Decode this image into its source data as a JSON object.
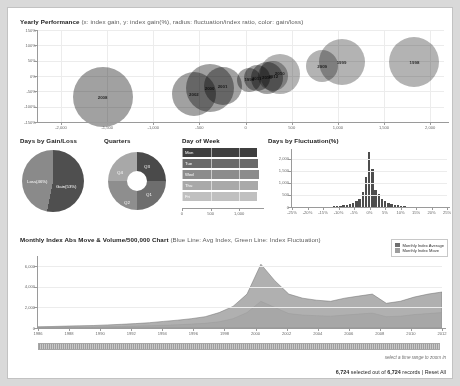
{
  "bubble": {
    "title": "Yearly Performance",
    "subtitle": "(x: index gain, y: index gain(%), radius: fluctuation/index ratio, color: gain/loss)",
    "ylabels": [
      "150%",
      "100%",
      "50%",
      "0%",
      "-50%",
      "-100%",
      "-150%"
    ],
    "xlabels": [
      "-2,000",
      "-1,500",
      "-1,000",
      "-500",
      "0",
      "500",
      "1,000",
      "1,500",
      "2,000"
    ],
    "points": [
      {
        "label": "2008",
        "x": -1550,
        "y": -70,
        "r": 30,
        "kind": "loss"
      },
      {
        "label": "2002",
        "x": -560,
        "y": -60,
        "r": 22,
        "kind": "loss"
      },
      {
        "label": "2000",
        "x": -390,
        "y": -40,
        "r": 24,
        "kind": "loss"
      },
      {
        "label": "2001",
        "x": -250,
        "y": -33,
        "r": 19,
        "kind": "loss"
      },
      {
        "label": "1990",
        "x": 40,
        "y": -12,
        "r": 12,
        "kind": "loss"
      },
      {
        "label": "2011",
        "x": 120,
        "y": -8,
        "r": 13,
        "kind": "loss"
      },
      {
        "label": "2015",
        "x": 230,
        "y": -5,
        "r": 16,
        "kind": "loss"
      },
      {
        "label": "2012",
        "x": 300,
        "y": 0,
        "r": 15,
        "kind": "gain"
      },
      {
        "label": "2010",
        "x": 370,
        "y": 8,
        "r": 20,
        "kind": "gain"
      },
      {
        "label": "2009",
        "x": 830,
        "y": 32,
        "r": 16,
        "kind": "gain"
      },
      {
        "label": "1999",
        "x": 1040,
        "y": 45,
        "r": 23,
        "kind": "gain"
      },
      {
        "label": "1998",
        "x": 1830,
        "y": 45,
        "r": 25,
        "kind": "gain"
      }
    ]
  },
  "chart_data": [
    {
      "type": "scatter",
      "title": "Yearly Performance",
      "xlabel": "index gain",
      "ylabel": "index gain(%)",
      "xlim": [
        -2250,
        2150
      ],
      "ylim": [
        -150,
        150
      ],
      "grid": true,
      "series": [
        {
          "name": "years",
          "points": [
            {
              "label": "2008",
              "x": -1550,
              "y": -70
            },
            {
              "label": "2002",
              "x": -560,
              "y": -60
            },
            {
              "label": "2000",
              "x": -390,
              "y": -40
            },
            {
              "label": "2001",
              "x": -250,
              "y": -33
            },
            {
              "label": "1990",
              "x": 40,
              "y": -12
            },
            {
              "label": "2011",
              "x": 120,
              "y": -8
            },
            {
              "label": "2015",
              "x": 230,
              "y": -5
            },
            {
              "label": "2012",
              "x": 300,
              "y": 0
            },
            {
              "label": "2010",
              "x": 370,
              "y": 8
            },
            {
              "label": "2009",
              "x": 830,
              "y": 32
            },
            {
              "label": "1999",
              "x": 1040,
              "y": 45
            },
            {
              "label": "1998",
              "x": 1830,
              "y": 45
            }
          ]
        }
      ]
    },
    {
      "type": "pie",
      "title": "Days by Gain/Loss",
      "categories": [
        "Gain(53%)",
        "Loss(46%)"
      ],
      "values": [
        53,
        46
      ]
    },
    {
      "type": "pie",
      "title": "Quarters",
      "categories": [
        "Q1",
        "Q2",
        "Q3",
        "Q4"
      ],
      "values": [
        25,
        25,
        25,
        25
      ]
    },
    {
      "type": "bar",
      "title": "Day of Week",
      "categories": [
        "Mon",
        "Tue",
        "Wed",
        "Thu",
        "Fri"
      ],
      "values": [
        1310,
        1330,
        1340,
        1330,
        1320
      ],
      "xlim": [
        0,
        1400
      ],
      "xticks": [
        "0",
        "500",
        "1,000"
      ]
    },
    {
      "type": "bar",
      "title": "Days by Fluctuation(%)",
      "xlabel": "fluctuation(%)",
      "ylabel": "days",
      "ylim": [
        0,
        2400
      ],
      "yticks": [
        "0",
        "500",
        "1,000",
        "1,500",
        "2,000"
      ],
      "xticks": [
        "-25%",
        "-20%",
        "-15%",
        "-10%",
        "-5%",
        "0%",
        "5%",
        "10%",
        "15%",
        "20%",
        "25%"
      ],
      "categories": [
        "-6%",
        "-5%",
        "-4%",
        "-3%",
        "-2%",
        "-1%",
        "0%",
        "1%",
        "2%",
        "3%",
        "4%",
        "5%",
        "6%"
      ],
      "values": [
        30,
        55,
        90,
        170,
        330,
        1250,
        2280,
        1580,
        520,
        250,
        130,
        70,
        35
      ]
    },
    {
      "type": "area",
      "title": "Monthly Index Abs Move & Volume/500,000 Chart",
      "ylim": [
        0,
        7000
      ],
      "yticks": [
        "0",
        "2,000",
        "4,000",
        "6,000"
      ],
      "xticks": [
        "1986",
        "1988",
        "1990",
        "1992",
        "1994",
        "1996",
        "1998",
        "2000",
        "2002",
        "2004",
        "2006",
        "2008",
        "2010",
        "2012"
      ],
      "series": [
        {
          "name": "Monthly Index Average",
          "values": [
            120,
            150,
            180,
            210,
            240,
            300,
            360,
            430,
            520,
            640,
            760,
            900,
            1100,
            1500,
            2100,
            3300,
            6200,
            4600,
            3300,
            2900,
            2700,
            2600,
            2900,
            3100,
            3300,
            2400,
            2600,
            3000,
            3300,
            3500
          ]
        },
        {
          "name": "Monthly Index Move",
          "values": [
            60,
            70,
            80,
            90,
            110,
            130,
            150,
            180,
            210,
            260,
            310,
            380,
            460,
            600,
            900,
            1500,
            2600,
            2000,
            1400,
            1250,
            1200,
            1150,
            1250,
            1350,
            1450,
            1100,
            1150,
            1300,
            1400,
            1500
          ]
        }
      ]
    }
  ],
  "pie_panel": {
    "title": "Days by Gain/Loss",
    "gain_label": "Gain(53%)",
    "loss_label": "Loss(46%)",
    "gain_color": "#4f4f4f",
    "loss_color": "#8a8a8a"
  },
  "donut_panel": {
    "title": "Quarters",
    "slices": [
      {
        "label": "Q3",
        "color": "#4a4a4a"
      },
      {
        "label": "Q1",
        "color": "#6e6e6e"
      },
      {
        "label": "Q2",
        "color": "#8e8e8e"
      },
      {
        "label": "Q4",
        "color": "#a8a8a8"
      }
    ]
  },
  "dow_panel": {
    "title": "Day of Week",
    "bars": [
      {
        "label": "Mon",
        "value": 1310,
        "color": "#3f3f3f"
      },
      {
        "label": "Tue",
        "value": 1330,
        "color": "#6a6a6a"
      },
      {
        "label": "Wed",
        "value": 1340,
        "color": "#8c8c8c"
      },
      {
        "label": "Thu",
        "value": 1330,
        "color": "#a9a9a9"
      },
      {
        "label": "Fri",
        "value": 1320,
        "color": "#c0c0c0"
      }
    ],
    "xticks": [
      "0",
      "500",
      "1,000"
    ]
  },
  "hist_panel": {
    "title": "Days by Fluctuation(%)",
    "yticks": [
      "2,000",
      "1,500",
      "1,000",
      "500",
      "0"
    ],
    "xticks": [
      "-25%",
      "-20%",
      "-15%",
      "-10%",
      "-5%",
      "0%",
      "5%",
      "10%",
      "15%",
      "20%",
      "25%"
    ],
    "bars": [
      30,
      45,
      60,
      75,
      95,
      120,
      170,
      250,
      330,
      620,
      1250,
      2280,
      1580,
      700,
      520,
      330,
      250,
      180,
      130,
      95,
      70,
      50,
      35
    ]
  },
  "bottom": {
    "title": "Monthly Index Abs Move & Volume/500,000 Chart",
    "subtitle": "(Blue Line: Avg Index, Green Line: Index Fluctuation)",
    "legend": [
      {
        "label": "Monthly Index Average",
        "color": "#6f6f6f"
      },
      {
        "label": "Monthly Index Move",
        "color": "#9d9d9d"
      }
    ],
    "yticks": [
      "6,000",
      "4,000",
      "2,000",
      "0"
    ],
    "xticks": [
      "1986",
      "1988",
      "1990",
      "1992",
      "1994",
      "1996",
      "1998",
      "2000",
      "2002",
      "2004",
      "2006",
      "2008",
      "2010",
      "2012"
    ],
    "brush_hint": "select a time range to zoom in"
  },
  "status": {
    "count": "6,724",
    "mid": " selected out of ",
    "total": "6,724",
    "suffix": " records | ",
    "reset": "Reset All"
  }
}
